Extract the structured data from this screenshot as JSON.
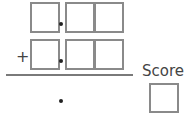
{
  "problem": {
    "row1": {
      "cells": [
        "",
        "",
        ""
      ],
      "decimal_point": "."
    },
    "row2": {
      "operator": "+",
      "cells": [
        "",
        "",
        ""
      ],
      "decimal_point": "."
    },
    "answer": {
      "decimal_point": "."
    }
  },
  "score": {
    "label": "Score",
    "value": ""
  }
}
